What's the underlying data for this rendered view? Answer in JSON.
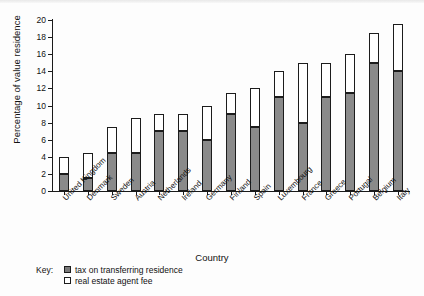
{
  "chart_data": {
    "type": "bar",
    "subtype": "stacked",
    "title": "",
    "xlabel": "Country",
    "ylabel": "Percentage of value residence",
    "ylim": [
      0,
      20
    ],
    "ytick_step": 2,
    "yticks": [
      0,
      2,
      4,
      6,
      8,
      10,
      12,
      14,
      16,
      18,
      20
    ],
    "grid": false,
    "legend_position": "below-left",
    "legend_title": "Key:",
    "categories": [
      "United Kingdom",
      "Denmark",
      "Sweden",
      "Austria",
      "Netherlands",
      "Ireland",
      "Germany",
      "Finland",
      "Spain",
      "Luxembourg",
      "France",
      "Greece",
      "Portugal",
      "Belgium",
      "Italy"
    ],
    "series": [
      {
        "name": "tax on transferring residence",
        "color": "#8a8a8a",
        "values": [
          2.0,
          1.5,
          4.5,
          4.5,
          7.0,
          7.0,
          6.0,
          9.0,
          7.5,
          11.0,
          8.0,
          11.0,
          11.5,
          15.0,
          14.0
        ]
      },
      {
        "name": "real estate agent fee",
        "color": "#ffffff",
        "values": [
          2.0,
          3.0,
          3.0,
          4.0,
          2.0,
          2.0,
          4.0,
          2.5,
          4.5,
          3.0,
          7.0,
          4.0,
          4.5,
          3.5,
          5.5
        ]
      }
    ],
    "totals": [
      4.0,
      4.5,
      7.5,
      8.5,
      9.0,
      9.0,
      10.0,
      11.5,
      12.0,
      14.0,
      15.0,
      15.0,
      16.0,
      18.5,
      19.5
    ]
  },
  "axis": {
    "x_title": "Country",
    "y_title": "Percentage of value residence"
  },
  "legend": {
    "key_label": "Key:",
    "items": [
      {
        "label": "tax on transferring residence",
        "swatch": "filled-grey"
      },
      {
        "label": "real estate agent fee",
        "swatch": "white-outline"
      }
    ]
  },
  "colors": {
    "tax_fill": "#8a8a8a",
    "fee_fill": "#ffffff",
    "outline": "#1c1c1c",
    "axis": "#1a1a1a",
    "text": "#111111"
  }
}
